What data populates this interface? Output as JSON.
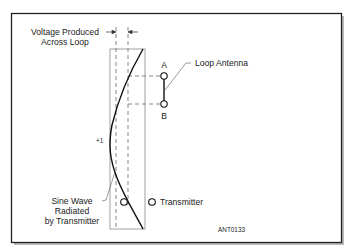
{
  "diagram": {
    "figure_id": "ANT0133",
    "labels": {
      "voltage_line1": "Voltage Produced",
      "voltage_line2": "Across Loop",
      "loop_antenna": "Loop Antenna",
      "point_a": "A",
      "point_b": "B",
      "peak": "+1",
      "sine_line1": "Sine Wave",
      "sine_line2": "Radiated",
      "sine_line3": "by Transmitter",
      "transmitter": "Transmitter"
    },
    "colors": {
      "line": "#1a1a1a",
      "dashed": "#555555",
      "frame": "#222222",
      "shadow": "#9a9a9a"
    }
  }
}
